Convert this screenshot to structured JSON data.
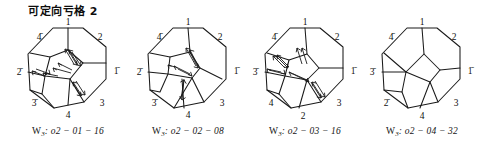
{
  "figure": {
    "title": "可定向亏格 2",
    "width": 483,
    "height": 151,
    "line_color": "#1a1a1a",
    "background": "#ffffff"
  },
  "panels": [
    {
      "id": "panel-1",
      "caption_prefix": "W",
      "caption_sub": "3",
      "caption_text": "W3: o2 − 01 − 16",
      "caption_body": ": o2 − 01 − 16",
      "code": "o2 − 01 − 16",
      "edge_labels": {
        "top": "1",
        "upper_left": "4̄",
        "upper_right": "2",
        "left": "2̄",
        "right": "1̄",
        "lower_left": "3̄",
        "lower_right": "3",
        "bottom": "4"
      },
      "arrow_count": 12,
      "has_arrows": true
    },
    {
      "id": "panel-2",
      "caption_prefix": "W",
      "caption_sub": "3",
      "caption_text": "W3: o2 − 02 − 08",
      "caption_body": ": o2 − 02 − 08",
      "code": "o2 − 02 − 08",
      "edge_labels": {
        "top": "1",
        "upper_left": "4̄",
        "upper_right": "2",
        "left": "2̄",
        "right": "1̄",
        "lower_left": "3̄",
        "lower_right": "3",
        "bottom": "4"
      },
      "arrow_count": 8,
      "has_arrows": true
    },
    {
      "id": "panel-3",
      "caption_prefix": "W",
      "caption_sub": "3",
      "caption_text": "W3: o2 − 03 − 16",
      "caption_body": ": o2 − 03 − 16",
      "code": "o2 − 03 − 16",
      "edge_labels": {
        "top": "1",
        "upper_left": "4̄",
        "upper_right": "2",
        "left": "3̄",
        "right": "1̄",
        "lower_left": "4",
        "lower_right": "3",
        "bottom": "2"
      },
      "arrow_count": 12,
      "has_arrows": true
    },
    {
      "id": "panel-4",
      "caption_prefix": "W",
      "caption_sub": "3",
      "caption_text": "W3: o2 − 04 − 32",
      "caption_body": ": o2 − 04 − 32",
      "code": "o2 − 04 − 32",
      "edge_labels": {
        "top": "1",
        "upper_left": "4̄",
        "upper_right": "2",
        "left": "3̄",
        "right": "1̄",
        "lower_left": "2̄",
        "lower_right": "3",
        "bottom": "4"
      },
      "arrow_count": 0,
      "has_arrows": false
    }
  ]
}
